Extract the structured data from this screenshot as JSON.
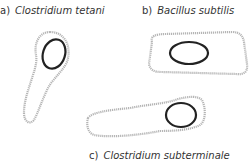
{
  "figure": {
    "panels": [
      {
        "letter": "a)",
        "name": "Clostridium tetani",
        "spore_position": "terminal"
      },
      {
        "letter": "b)",
        "name": "Bacillus subtilis",
        "spore_position": "central"
      },
      {
        "letter": "c)",
        "name": "Clostridium subterminale",
        "spore_position": "subterminal"
      }
    ],
    "colors": {
      "cell_outline": "#b0b0b0",
      "spore_outline": "#222222",
      "text": "#333333"
    }
  }
}
